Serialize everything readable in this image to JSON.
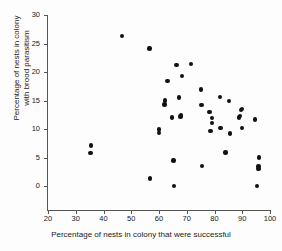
{
  "chart_data": {
    "type": "scatter",
    "title": "",
    "xlabel": "Percentage of nests in colony that were successful",
    "ylabel_line1": "Percentage of nests in colony",
    "ylabel_line2": "with brood parasitism",
    "xlim": [
      20,
      100
    ],
    "ylim": [
      0,
      30
    ],
    "xticks": [
      20,
      30,
      40,
      50,
      60,
      70,
      80,
      90,
      100
    ],
    "yticks": [
      0,
      5,
      10,
      15,
      20,
      25,
      30
    ],
    "grid": false,
    "legend": false,
    "marker": "filled-circle",
    "marker_color": "#111111",
    "points": [
      [
        35.3,
        5.8
      ],
      [
        35.6,
        7.1
      ],
      [
        46.6,
        26.3
      ],
      [
        56.6,
        24.1
      ],
      [
        56.8,
        1.3
      ],
      [
        59.9,
        9.3
      ],
      [
        60.1,
        9.9
      ],
      [
        62.0,
        14.3
      ],
      [
        62.2,
        15.0
      ],
      [
        63.0,
        18.4
      ],
      [
        64.7,
        12.0
      ],
      [
        65.2,
        4.5
      ],
      [
        65.3,
        0.0
      ],
      [
        66.3,
        21.2
      ],
      [
        67.3,
        15.5
      ],
      [
        67.8,
        12.2
      ],
      [
        68.0,
        12.5
      ],
      [
        68.2,
        19.3
      ],
      [
        71.6,
        21.4
      ],
      [
        75.2,
        16.9
      ],
      [
        75.3,
        14.2
      ],
      [
        75.4,
        3.5
      ],
      [
        78.2,
        13.0
      ],
      [
        78.6,
        9.7
      ],
      [
        79.0,
        11.1
      ],
      [
        79.2,
        11.9
      ],
      [
        81.9,
        15.6
      ],
      [
        82.2,
        10.2
      ],
      [
        84.0,
        5.9
      ],
      [
        85.2,
        14.9
      ],
      [
        85.6,
        9.2
      ],
      [
        88.9,
        12.0
      ],
      [
        89.1,
        12.3
      ],
      [
        89.5,
        13.3
      ],
      [
        89.8,
        13.5
      ],
      [
        89.9,
        10.2
      ],
      [
        94.7,
        11.7
      ],
      [
        95.4,
        0.0
      ],
      [
        95.8,
        3.0
      ],
      [
        95.9,
        3.4
      ],
      [
        96.1,
        5.0
      ]
    ]
  },
  "axis": {
    "y_tick_labels": [
      "0",
      "5",
      "10",
      "15",
      "20",
      "25",
      "30"
    ],
    "x_tick_labels": [
      "20",
      "30",
      "40",
      "50",
      "60",
      "70",
      "80",
      "90",
      "100"
    ]
  }
}
